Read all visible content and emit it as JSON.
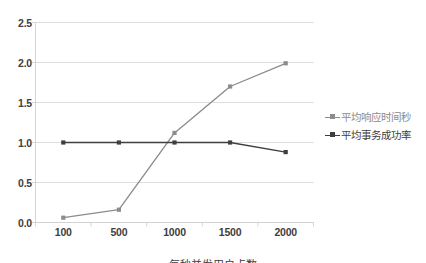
{
  "chart_data": {
    "type": "line",
    "title": "",
    "subtitle": "",
    "xlabel": "",
    "ylabel": "",
    "categories": [
      "100",
      "500",
      "1000",
      "1500",
      "2000"
    ],
    "series": [
      {
        "name": "平均响应时间秒",
        "color": "#8c8c8c",
        "marker": "square",
        "values": [
          0.06,
          0.16,
          1.12,
          1.7,
          1.99
        ]
      },
      {
        "name": "平均事务成功率",
        "color": "#3f3f3f",
        "marker": "square",
        "values": [
          1.0,
          1.0,
          1.0,
          1.0,
          0.88
        ]
      }
    ],
    "ylim": [
      0.0,
      2.5
    ],
    "yticks": [
      "0.0",
      "0.5",
      "1.0",
      "1.5",
      "2.0",
      "2.5"
    ],
    "ytick_values": [
      0.0,
      0.5,
      1.0,
      1.5,
      2.0,
      2.5
    ],
    "grid": "horizontal",
    "legend_position": "right",
    "plot_background": "#ffffff",
    "gridline_color": "#d9d9d9",
    "axis_color": "#d0d0d0",
    "tick_label_color": "#404040"
  },
  "caption": {
    "text": "每秒并发用户点数"
  }
}
